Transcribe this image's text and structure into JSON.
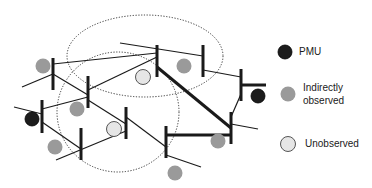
{
  "legend": {
    "pmu": {
      "label": "PMU",
      "color": "#1c1c1c"
    },
    "indirect": {
      "label_line1": "Indirectly",
      "label_line2": "observed",
      "color": "#9a9a9a"
    },
    "unobserved": {
      "label": "Unobserved",
      "color": "#e6e6e6"
    }
  },
  "colors": {
    "line": "#1a1a1a",
    "zone": "#333333",
    "background": "#ffffff"
  },
  "network": {
    "zones": [
      {
        "id": "zone-upper",
        "cx": 145,
        "cy": 56,
        "rx": 78,
        "ry": 41
      },
      {
        "id": "zone-lower",
        "cx": 118,
        "cy": 112,
        "rx": 61,
        "ry": 60
      }
    ],
    "buses": [
      {
        "id": "b1",
        "x": 53,
        "y1": 58,
        "y2": 90
      },
      {
        "id": "b2",
        "x": 157,
        "y1": 45,
        "y2": 77
      },
      {
        "id": "b3",
        "x": 203,
        "y1": 45,
        "y2": 77
      },
      {
        "id": "b4",
        "x": 88,
        "y1": 76,
        "y2": 108
      },
      {
        "id": "b5",
        "x": 42,
        "y1": 100,
        "y2": 133
      },
      {
        "id": "b6",
        "x": 126,
        "y1": 107,
        "y2": 139
      },
      {
        "id": "b7",
        "x": 81,
        "y1": 128,
        "y2": 160
      },
      {
        "id": "b8",
        "x": 166,
        "y1": 126,
        "y2": 158
      },
      {
        "id": "b9",
        "x": 241,
        "y1": 69,
        "y2": 101
      },
      {
        "id": "b10",
        "x": 231,
        "y1": 112,
        "y2": 144
      }
    ],
    "lines": [
      {
        "x1": 53,
        "y1": 64,
        "x2": 157,
        "y2": 53,
        "w": 1.2
      },
      {
        "x1": 120,
        "y1": 43,
        "x2": 203,
        "y2": 56,
        "w": 1.2
      },
      {
        "x1": 88,
        "y1": 90,
        "x2": 157,
        "y2": 57,
        "w": 1.2
      },
      {
        "x1": 203,
        "y1": 70,
        "x2": 241,
        "y2": 77,
        "w": 1.2
      },
      {
        "x1": 22,
        "y1": 87,
        "x2": 53,
        "y2": 74,
        "w": 1.2
      },
      {
        "x1": 53,
        "y1": 74,
        "x2": 88,
        "y2": 95,
        "w": 1.2
      },
      {
        "x1": 42,
        "y1": 109,
        "x2": 88,
        "y2": 97,
        "w": 1.2
      },
      {
        "x1": 88,
        "y1": 100,
        "x2": 126,
        "y2": 124,
        "w": 1.2
      },
      {
        "x1": 14,
        "y1": 107,
        "x2": 42,
        "y2": 114,
        "w": 1.2
      },
      {
        "x1": 42,
        "y1": 122,
        "x2": 81,
        "y2": 149,
        "w": 1.2
      },
      {
        "x1": 56,
        "y1": 160,
        "x2": 126,
        "y2": 131,
        "w": 1.2
      },
      {
        "x1": 126,
        "y1": 117,
        "x2": 166,
        "y2": 147,
        "w": 1.2
      },
      {
        "x1": 166,
        "y1": 155,
        "x2": 201,
        "y2": 167,
        "w": 1.2
      },
      {
        "x1": 231,
        "y1": 124,
        "x2": 258,
        "y2": 129,
        "w": 1.2
      },
      {
        "x1": 231,
        "y1": 117,
        "x2": 241,
        "y2": 94,
        "w": 1.2
      },
      {
        "x1": 157,
        "y1": 67,
        "x2": 231,
        "y2": 128,
        "w": 3
      },
      {
        "x1": 166,
        "y1": 135,
        "x2": 231,
        "y2": 135,
        "w": 3
      },
      {
        "x1": 241,
        "y1": 85,
        "x2": 266,
        "y2": 85,
        "w": 3
      }
    ],
    "nodes": [
      {
        "type": "pmu",
        "cx": 258,
        "cy": 96,
        "r": 7
      },
      {
        "type": "pmu",
        "cx": 32,
        "cy": 119,
        "r": 7
      },
      {
        "type": "indirect",
        "cx": 43,
        "cy": 66,
        "r": 7.5
      },
      {
        "type": "indirect",
        "cx": 184,
        "cy": 66,
        "r": 7.5
      },
      {
        "type": "indirect",
        "cx": 77,
        "cy": 109,
        "r": 7.5
      },
      {
        "type": "indirect",
        "cx": 55,
        "cy": 147,
        "r": 7.5
      },
      {
        "type": "indirect",
        "cx": 218,
        "cy": 141,
        "r": 7.5
      },
      {
        "type": "indirect",
        "cx": 175,
        "cy": 173,
        "r": 7.5
      },
      {
        "type": "unobserved",
        "cx": 143,
        "cy": 77,
        "r": 7.5
      },
      {
        "type": "unobserved",
        "cx": 114,
        "cy": 129,
        "r": 7.5
      }
    ]
  }
}
